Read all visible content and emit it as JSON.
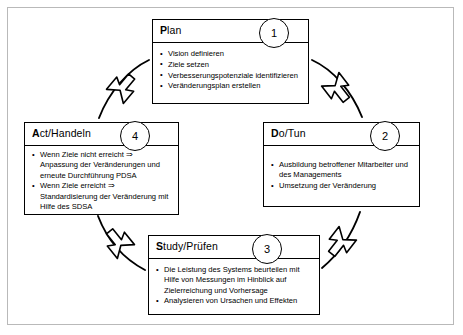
{
  "diagram": {
    "frame_color": "#b9b9b9",
    "line_color": "#000000",
    "background": "#ffffff",
    "phases": [
      {
        "id": "plan",
        "step": "1",
        "title_cap": "P",
        "title_rest": "lan",
        "bullets": [
          "Vision definieren",
          "Ziele setzen",
          "Verbesserungspotenziale identifizieren",
          "Veränderungsplan erstellen"
        ]
      },
      {
        "id": "do",
        "step": "2",
        "title_cap": "D",
        "title_rest": "o/Tun",
        "bullets": [
          "Ausbildung betroffener Mitarbeiter und des Managements",
          "Umsetzung der Veränderung"
        ]
      },
      {
        "id": "study",
        "step": "3",
        "title_cap": "S",
        "title_rest": "tudy/Prüfen",
        "bullets": [
          "Die Leistung des Systems beurteilen mit Hilfe von Messungen im Hinblick auf Zielerreichung und Vorhersage",
          "Analysieren von Ursachen und Effekten"
        ]
      },
      {
        "id": "act",
        "step": "4",
        "title_cap": "A",
        "title_rest": "ct/Handeln",
        "bullets": [
          "Wenn Ziele nicht erreicht ⇒ Anpassung der Veränderungen und erneute Durchführung PDSA",
          "Wenn Ziele erreicht ⇒ Standardisierung der Veränderung mit Hilfe des SDSA"
        ]
      }
    ],
    "arrows": [
      {
        "id": "plan-to-do",
        "direction": "down-right"
      },
      {
        "id": "do-to-study",
        "direction": "down-left"
      },
      {
        "id": "study-to-act",
        "direction": "up-left"
      },
      {
        "id": "act-to-plan",
        "direction": "up-right"
      }
    ]
  }
}
